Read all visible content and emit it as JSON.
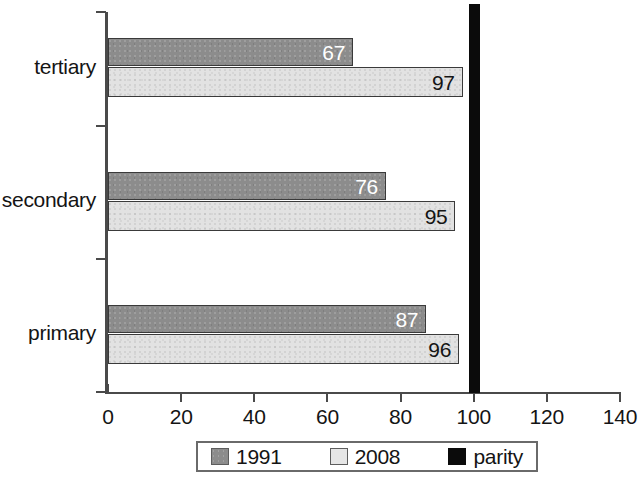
{
  "chart_data": {
    "type": "bar",
    "orientation": "horizontal",
    "title": "",
    "xlabel": "",
    "ylabel": "",
    "categories": [
      "primary",
      "secondary",
      "tertiary"
    ],
    "series": [
      {
        "name": "1991",
        "values": [
          87,
          76,
          67
        ],
        "color": "#8c8c8c"
      },
      {
        "name": "2008",
        "values": [
          96,
          95,
          97
        ],
        "color": "#e2e2e2"
      }
    ],
    "reference_line": {
      "name": "parity",
      "value": 100,
      "color": "#0b0b0b"
    },
    "xlim": [
      0,
      140
    ],
    "xticks": [
      0,
      20,
      40,
      60,
      80,
      100,
      120,
      140
    ],
    "xtick_labels": [
      "0",
      "20",
      "40",
      "60",
      "80",
      "100",
      "120",
      "140"
    ],
    "grid": false,
    "legend": {
      "position": "bottom",
      "entries": [
        {
          "label": "1991",
          "swatch": "dark-gray"
        },
        {
          "label": "2008",
          "swatch": "light-gray"
        },
        {
          "label": "parity",
          "swatch": "black"
        }
      ]
    },
    "bar_labels": {
      "primary": {
        "1991": "87",
        "2008": "96"
      },
      "secondary": {
        "1991": "76",
        "2008": "95"
      },
      "tertiary": {
        "1991": "67",
        "2008": "97"
      }
    }
  }
}
